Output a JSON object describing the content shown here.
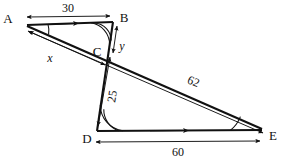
{
  "figure": {
    "type": "geometry-diagram",
    "vertices": [
      {
        "id": "A",
        "label": "A",
        "x": 14,
        "y": 18,
        "node_x": 27,
        "node_y": 23
      },
      {
        "id": "B",
        "label": "B",
        "x": 122,
        "y": 17,
        "node_x": 112,
        "node_y": 23
      },
      {
        "id": "C",
        "label": "C",
        "x": 97,
        "y": 52,
        "node_x": 106,
        "node_y": 49
      },
      {
        "id": "D",
        "label": "D",
        "x": 88,
        "y": 140,
        "node_x": 97,
        "node_y": 131
      },
      {
        "id": "E",
        "label": "E",
        "x": 270,
        "y": 137,
        "node_x": 262,
        "node_y": 131
      }
    ],
    "measures": [
      {
        "id": "AB",
        "label": "30",
        "x": 64,
        "y": 14,
        "kind": "length"
      },
      {
        "id": "BC",
        "label": "y",
        "x": 122,
        "y": 46,
        "kind": "unknown"
      },
      {
        "id": "AC",
        "label": "x",
        "x": 48,
        "y": 60,
        "kind": "unknown"
      },
      {
        "id": "CD",
        "label": "25",
        "x": 114,
        "y": 95,
        "kind": "length"
      },
      {
        "id": "AE",
        "label": "62",
        "x": 190,
        "y": 84,
        "kind": "length"
      },
      {
        "id": "DE",
        "label": "60",
        "x": 177,
        "y": 155,
        "kind": "length"
      }
    ],
    "angle_marks": [
      {
        "id": "angle-A",
        "vertex": "A",
        "arcs": 1
      },
      {
        "id": "angle-B",
        "vertex": "B",
        "arcs": 2
      },
      {
        "id": "angle-D",
        "vertex": "D",
        "arcs": 2
      },
      {
        "id": "angle-E",
        "vertex": "E",
        "arcs": 1
      }
    ],
    "parallel_marks": [
      {
        "id": "parallel-AB",
        "on": "AB",
        "ticks": 1
      },
      {
        "id": "parallel-DE",
        "on": "DE",
        "ticks": 1
      }
    ]
  }
}
